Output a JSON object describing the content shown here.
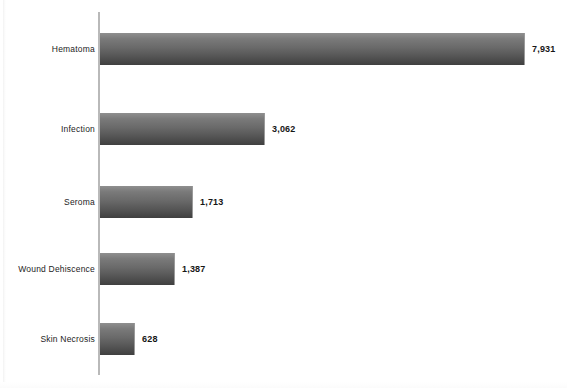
{
  "chart_data": {
    "type": "bar",
    "orientation": "horizontal",
    "title": "",
    "subtitle": "",
    "xlabel": "",
    "ylabel": "",
    "categories": [
      "Hematoma",
      "Infection",
      "Seroma",
      "Wound Dehiscence",
      "Skin Necrosis"
    ],
    "values": [
      7931,
      3062,
      1713,
      1387,
      628
    ],
    "value_labels": [
      "7,931",
      "3,062",
      "1,713",
      "1,387",
      "628"
    ],
    "xlim": [
      0,
      7931
    ],
    "grid": false,
    "legend": null,
    "annotations": []
  },
  "style": {
    "background": "#ffffff",
    "bar_top_color": "#8f8f8f",
    "bar_bottom_color": "#3f3f3f",
    "axis_color": "#b9b9b9",
    "label_color": "#1d1d1d",
    "value_color": "#161616"
  }
}
